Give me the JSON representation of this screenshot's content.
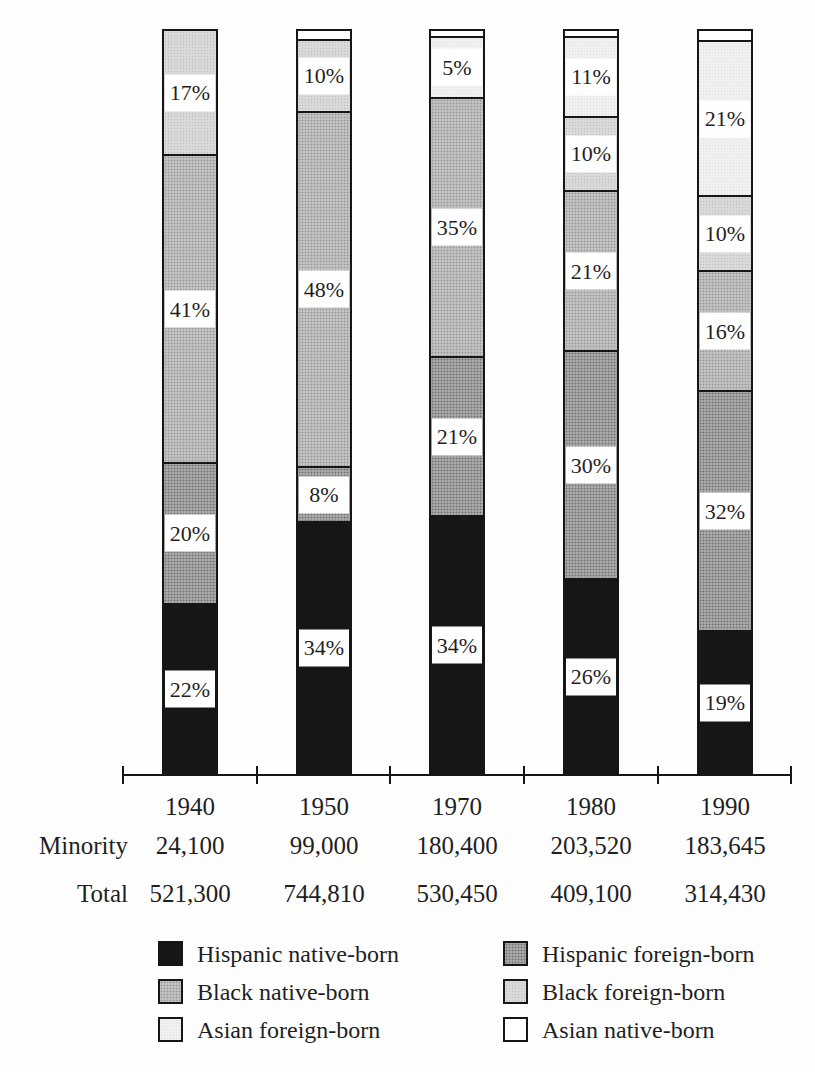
{
  "rows": {
    "minority_label": "Minority",
    "total_label": "Total"
  },
  "legend": {
    "position": "bottom",
    "columns": [
      {
        "items": [
          {
            "key": "hispanic_native",
            "label": "Hispanic native-born"
          },
          {
            "key": "black_native",
            "label": "Black native-born"
          },
          {
            "key": "asian_foreign",
            "label": "Asian foreign-born"
          }
        ]
      },
      {
        "items": [
          {
            "key": "hispanic_foreign",
            "label": "Hispanic foreign-born"
          },
          {
            "key": "black_foreign",
            "label": "Black foreign-born"
          },
          {
            "key": "asian_native",
            "label": "Asian native-born"
          }
        ]
      }
    ]
  },
  "chart_data": {
    "type": "bar",
    "stacked": true,
    "unit": "percent",
    "ylim": [
      0,
      100
    ],
    "grid": false,
    "title": "",
    "xlabel": "",
    "ylabel": "",
    "categories": [
      "1940",
      "1950",
      "1970",
      "1980",
      "1990"
    ],
    "series": [
      {
        "name": "Hispanic native-born",
        "key": "hispanic_native",
        "color": "#161616",
        "values": [
          22,
          34,
          34,
          26,
          19
        ]
      },
      {
        "name": "Hispanic foreign-born",
        "key": "hispanic_foreign",
        "color": "#9a9a9a",
        "values": [
          20,
          8,
          21,
          30,
          32
        ]
      },
      {
        "name": "Black native-born",
        "key": "black_native",
        "color": "#b9b9b9",
        "values": [
          41,
          48,
          35,
          21,
          16
        ]
      },
      {
        "name": "Black foreign-born",
        "key": "black_foreign",
        "color": "#d2d2d2",
        "values": [
          17,
          10,
          0,
          10,
          10
        ]
      },
      {
        "name": "Asian foreign-born",
        "key": "asian_foreign",
        "color": "#ededed",
        "values": [
          0,
          0,
          5,
          11,
          21
        ]
      },
      {
        "name": "Asian native-born",
        "key": "asian_native",
        "color": "#ffffff",
        "values": [
          0,
          1,
          1,
          1,
          1
        ]
      }
    ],
    "table_rows": {
      "minority": [
        "24,100",
        "99,000",
        "180,400",
        "203,520",
        "183,645"
      ],
      "total": [
        "521,300",
        "744,810",
        "530,450",
        "409,100",
        "314,430"
      ]
    },
    "bars": [
      {
        "year": "1940",
        "minority": "24,100",
        "total": "521,300",
        "segments": [
          {
            "key": "hispanic_native",
            "pct": 22.6,
            "label": "22%"
          },
          {
            "key": "hispanic_foreign",
            "pct": 19.1,
            "label": "20%"
          },
          {
            "key": "black_native",
            "pct": 41.4,
            "label": "41%"
          },
          {
            "key": "black_foreign",
            "pct": 16.9,
            "label": "17%"
          }
        ]
      },
      {
        "year": "1950",
        "minority": "99,000",
        "total": "744,810",
        "segments": [
          {
            "key": "hispanic_native",
            "pct": 33.7,
            "label": "34%"
          },
          {
            "key": "hispanic_foreign",
            "pct": 7.4,
            "label": "8%"
          },
          {
            "key": "black_native",
            "pct": 47.9,
            "label": "48%"
          },
          {
            "key": "black_foreign",
            "pct": 9.7,
            "label": "10%"
          },
          {
            "key": "asian_native",
            "pct": 1.3,
            "label": ""
          }
        ]
      },
      {
        "year": "1970",
        "minority": "180,400",
        "total": "530,450",
        "segments": [
          {
            "key": "hispanic_native",
            "pct": 34.5,
            "label": "34%"
          },
          {
            "key": "hispanic_foreign",
            "pct": 21.4,
            "label": "21%"
          },
          {
            "key": "black_native",
            "pct": 35.0,
            "label": "35%"
          },
          {
            "key": "asian_foreign",
            "pct": 8.2,
            "label": "5%"
          },
          {
            "key": "asian_native",
            "pct": 0.9,
            "label": ""
          }
        ]
      },
      {
        "year": "1980",
        "minority": "203,520",
        "total": "409,100",
        "segments": [
          {
            "key": "hispanic_native",
            "pct": 26.0,
            "label": "26%"
          },
          {
            "key": "hispanic_foreign",
            "pct": 30.7,
            "label": "30%"
          },
          {
            "key": "black_native",
            "pct": 21.6,
            "label": "21%"
          },
          {
            "key": "black_foreign",
            "pct": 10.0,
            "label": "10%"
          },
          {
            "key": "asian_foreign",
            "pct": 10.8,
            "label": "11%"
          },
          {
            "key": "asian_native",
            "pct": 0.9,
            "label": ""
          }
        ]
      },
      {
        "year": "1990",
        "minority": "183,645",
        "total": "314,430",
        "segments": [
          {
            "key": "hispanic_native",
            "pct": 19.0,
            "label": "19%"
          },
          {
            "key": "hispanic_foreign",
            "pct": 32.3,
            "label": "32%"
          },
          {
            "key": "black_native",
            "pct": 16.2,
            "label": "16%"
          },
          {
            "key": "black_foreign",
            "pct": 10.1,
            "label": "10%"
          },
          {
            "key": "asian_foreign",
            "pct": 20.9,
            "label": "21%"
          },
          {
            "key": "asian_native",
            "pct": 1.5,
            "label": ""
          }
        ]
      }
    ]
  }
}
